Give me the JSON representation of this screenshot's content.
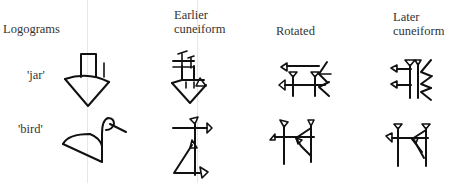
{
  "headers": {
    "logograms": "Logograms",
    "earlier_line1": "Earlier",
    "earlier_line2": "cuneiform",
    "rotated": "Rotated",
    "later_line1": "Later",
    "later_line2": "cuneiform"
  },
  "rows": [
    {
      "label": "'jar'",
      "glyphs": [
        "jar-logogram-icon",
        "jar-earlier-cuneiform-icon",
        "jar-rotated-cuneiform-icon",
        "jar-later-cuneiform-icon"
      ]
    },
    {
      "label": "'bird'",
      "glyphs": [
        "bird-logogram-icon",
        "bird-earlier-cuneiform-icon",
        "bird-rotated-cuneiform-icon",
        "bird-later-cuneiform-icon"
      ]
    }
  ],
  "colors": {
    "ink": "#111111",
    "text": "#333333",
    "background": "#ffffff",
    "guide": "#e6e6e6"
  }
}
